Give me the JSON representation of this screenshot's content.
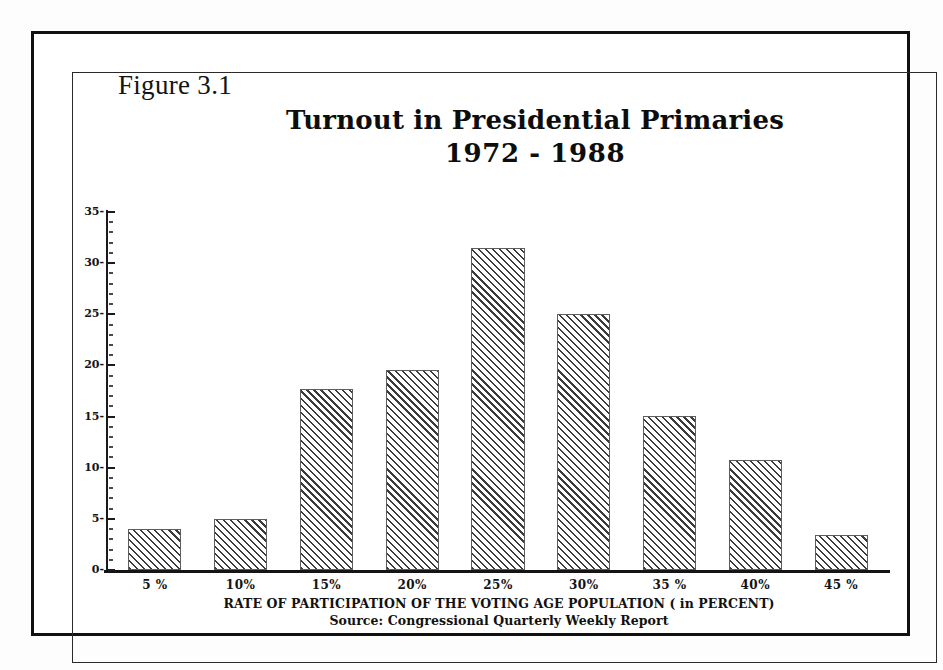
{
  "figure": {
    "label": "Figure 3.1"
  },
  "chart_data": {
    "type": "bar",
    "title": "Turnout in Presidential Primaries",
    "subtitle": "1972 - 1988",
    "title_lines": [
      "Turnout in Presidential Primaries",
      "1972 - 1988"
    ],
    "xlabel": "RATE OF PARTICIPATION OF THE VOTING AGE POPULATION ( in  PERCENT)",
    "ylabel": "",
    "source": "Source: Congressional Quarterly Weekly  Report",
    "categories": [
      "5 %",
      "10%",
      "15%",
      "20%",
      "25%",
      "30%",
      "35 %",
      "40%",
      "45 %"
    ],
    "values": [
      4,
      5,
      17.7,
      19.6,
      31.5,
      25,
      15.1,
      10.8,
      3.4
    ],
    "ylim": [
      0,
      35
    ],
    "y_major_ticks": [
      0,
      5,
      10,
      15,
      20,
      25,
      30,
      35
    ],
    "y_tick_labels": [
      "0-",
      "5-",
      "10-",
      "15-",
      "20-",
      "25-",
      "30-",
      "35-"
    ],
    "y_minor_tick_step": 1,
    "grid": false,
    "legend": null,
    "bar_fill": "diagonal-hatch",
    "bar_color": "#3b3b3b",
    "axis_color": "#141414"
  }
}
